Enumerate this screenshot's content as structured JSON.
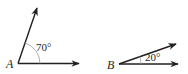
{
  "figure": {
    "angles": [
      {
        "vertex_label": "A",
        "measure_label": "70°",
        "measure_degrees": 70
      },
      {
        "vertex_label": "B",
        "measure_label": "20°",
        "measure_degrees": 20
      }
    ],
    "colors": {
      "stroke": "#231f20",
      "arc": "#9a9a9a",
      "background": "#ffffff"
    }
  }
}
